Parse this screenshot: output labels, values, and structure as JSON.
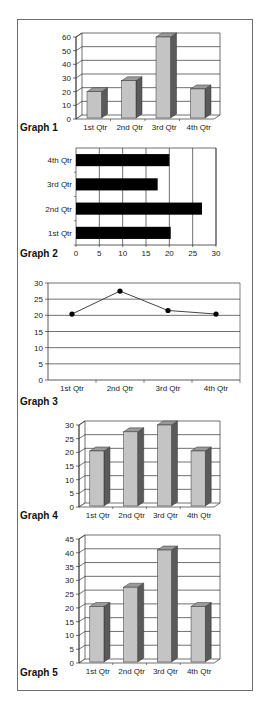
{
  "colors": {
    "frame": "#6e6e6e",
    "grid": "#333333",
    "bar_front": "#c4c4c4",
    "bar_side": "#5a5a5a",
    "bar_top": "#9a9a9a",
    "hbar": "#000000",
    "line": "#444444",
    "marker": "#000000"
  },
  "chart_data": [
    {
      "id": "graph1",
      "type": "bar",
      "style": "3d-column",
      "caption": "Graph 1",
      "categories": [
        "1st Qtr",
        "2nd Qtr",
        "3rd Qtr",
        "4th Qtr"
      ],
      "values": [
        20,
        28,
        60,
        22
      ],
      "ylim": [
        0,
        60
      ],
      "yticks": [
        0,
        10,
        20,
        30,
        40,
        50,
        60
      ],
      "xlabel": "",
      "ylabel": "",
      "grid": true,
      "legend": "none"
    },
    {
      "id": "graph2",
      "type": "bar",
      "style": "horizontal",
      "caption": "Graph 2",
      "categories": [
        "1st Qtr",
        "2nd Qtr",
        "3rd Qtr",
        "4th Qtr"
      ],
      "values": [
        20.3,
        27,
        17.5,
        20
      ],
      "xlim": [
        0,
        30
      ],
      "xticks": [
        0,
        5,
        10,
        15,
        20,
        25,
        30
      ],
      "xlabel": "",
      "ylabel": "",
      "grid": true,
      "legend": "none"
    },
    {
      "id": "graph3",
      "type": "line",
      "caption": "Graph 3",
      "categories": [
        "1st Qtr",
        "2nd Qtr",
        "3rd Qtr",
        "4th Qtr"
      ],
      "values": [
        20.4,
        27.5,
        21.5,
        20.4
      ],
      "ylim": [
        0,
        30
      ],
      "yticks": [
        0,
        5,
        10,
        15,
        20,
        25,
        30
      ],
      "xlabel": "",
      "ylabel": "",
      "grid": true,
      "legend": "none"
    },
    {
      "id": "graph4",
      "type": "bar",
      "style": "3d-column",
      "caption": "Graph 4",
      "categories": [
        "1st Qtr",
        "2nd Qtr",
        "3rd Qtr",
        "4th Qtr"
      ],
      "values": [
        20.5,
        27.5,
        30,
        20.5
      ],
      "ylim": [
        0,
        30
      ],
      "yticks": [
        0,
        5,
        10,
        15,
        20,
        25,
        30
      ],
      "xlabel": "",
      "ylabel": "",
      "grid": true,
      "legend": "none"
    },
    {
      "id": "graph5",
      "type": "bar",
      "style": "3d-column",
      "caption": "Graph 5",
      "categories": [
        "1st Qtr",
        "2nd Qtr",
        "3rd Qtr",
        "4th Qtr"
      ],
      "values": [
        20.5,
        27.5,
        41,
        20.5
      ],
      "ylim": [
        0,
        45
      ],
      "yticks": [
        0,
        5,
        10,
        15,
        20,
        25,
        30,
        35,
        40,
        45
      ],
      "xlabel": "",
      "ylabel": "",
      "grid": true,
      "legend": "none"
    }
  ]
}
